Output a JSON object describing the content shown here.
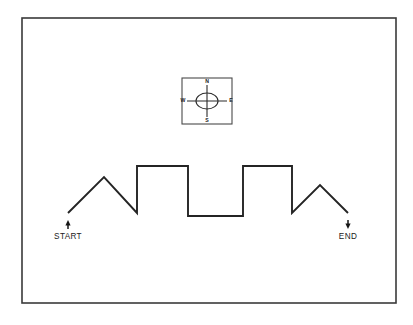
{
  "figure": {
    "background_color": "#ffffff",
    "border_color": "#3a3a3a",
    "line_color": "#242424"
  },
  "compass": {
    "name": "compass-rose",
    "north_label": "N",
    "east_label": "E",
    "south_label": "S",
    "west_label": "W",
    "box": {
      "x": 182,
      "y": 78,
      "width": 50,
      "height": 46
    },
    "center": {
      "x": 207,
      "y": 101
    },
    "ellipse_rx": 11,
    "ellipse_ry": 8
  },
  "markers": {
    "start": {
      "label": "START",
      "direction": "up",
      "x": 68,
      "label_y": 239
    },
    "end": {
      "label": "END",
      "direction": "down",
      "x": 348,
      "label_y": 239
    }
  },
  "chart_data": {
    "type": "line",
    "xlabel": "",
    "ylabel": "",
    "grid": false,
    "legend": "none",
    "xlim": [
      22,
      396
    ],
    "ylim": [
      18,
      303
    ],
    "annotations": [
      "START",
      "END",
      "N",
      "E",
      "S",
      "W"
    ],
    "series": [
      {
        "name": "route",
        "points": [
          [
            68,
            213
          ],
          [
            104,
            177
          ],
          [
            137,
            213
          ],
          [
            137,
            166
          ],
          [
            188,
            166
          ],
          [
            188,
            216
          ],
          [
            243,
            216
          ],
          [
            243,
            166
          ],
          [
            292,
            166
          ],
          [
            292,
            213
          ],
          [
            320,
            185
          ],
          [
            348,
            213
          ]
        ]
      }
    ],
    "path_d": "M 68 213 L 104 177 L 137 213 L 137 166 L 188 166 L 188 216 L 243 216 L 243 166 L 292 166 L 292 213 L 320 185 L 348 213"
  }
}
